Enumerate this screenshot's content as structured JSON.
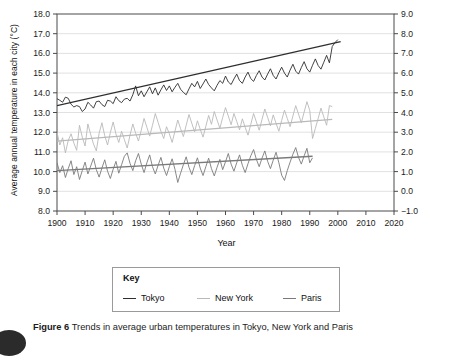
{
  "figure": {
    "caption_label": "Figure 6",
    "caption_text": "Trends in average urban temperatures in Tokyo, New York and Paris"
  },
  "legend": {
    "title": "Key",
    "entries": [
      {
        "label": "Tokyo",
        "color": "#2e2e2e"
      },
      {
        "label": "New York",
        "color": "#b9b9b9"
      },
      {
        "label": "Paris",
        "color": "#7a7a7a"
      }
    ]
  },
  "chart_data": {
    "type": "line",
    "title": "",
    "xlabel": "Year",
    "ylabel": "Average annual temperature in each city  (°C)",
    "y2label": "",
    "xlim": [
      1900,
      2020
    ],
    "ylim": [
      8.0,
      18.0
    ],
    "y2lim": [
      -1.0,
      9.0
    ],
    "grid": true,
    "legend_position": "below-plot",
    "xticks": [
      1900,
      1910,
      1920,
      1930,
      1940,
      1950,
      1960,
      1970,
      1980,
      1990,
      2000,
      2010,
      2020
    ],
    "xticklabels": [
      "1900",
      "1910",
      "1920",
      "1930",
      "1940",
      "1950",
      "1960",
      "1970",
      "1980",
      "1990",
      "2000",
      "2010",
      "2020"
    ],
    "yticks": [
      8.0,
      9.0,
      10.0,
      11.0,
      12.0,
      13.0,
      14.0,
      15.0,
      16.0,
      17.0,
      18.0
    ],
    "yticklabels": [
      "8.0",
      "9.0",
      "10.0",
      "11.0",
      "12.0",
      "13.0",
      "14.0",
      "15.0",
      "16.0",
      "17.0",
      "18.0"
    ],
    "y2ticks": [
      -1.0,
      0.0,
      1.0,
      2.0,
      3.0,
      4.0,
      5.0,
      6.0,
      7.0,
      8.0,
      9.0
    ],
    "y2ticklabels": [
      "−1.0",
      "0.0",
      "1.0",
      "2.0",
      "3.0",
      "4.0",
      "5.0",
      "6.0",
      "7.0",
      "8.0",
      "9.0"
    ],
    "series": [
      {
        "name": "Tokyo",
        "color": "#2e2e2e",
        "axis": "left",
        "x_start": 1900,
        "x_end": 2001,
        "trend": {
          "start_year": 1900,
          "end_year": 2001,
          "start_value": 13.35,
          "end_value": 16.6
        },
        "values": [
          13.7,
          13.62,
          13.52,
          13.78,
          13.72,
          13.42,
          13.28,
          13.35,
          13.3,
          13.05,
          13.18,
          13.52,
          13.38,
          13.22,
          13.55,
          13.58,
          13.4,
          13.3,
          13.62,
          13.58,
          13.45,
          13.8,
          13.6,
          13.5,
          13.68,
          13.72,
          13.58,
          13.9,
          14.35,
          13.85,
          14.1,
          13.8,
          14.05,
          14.3,
          13.95,
          14.25,
          13.88,
          14.15,
          14.4,
          14.12,
          14.35,
          14.05,
          14.28,
          14.48,
          14.18,
          14.02,
          13.9,
          14.2,
          14.48,
          14.3,
          14.58,
          14.22,
          14.45,
          14.7,
          14.42,
          14.25,
          14.1,
          14.38,
          14.62,
          14.48,
          14.85,
          14.55,
          14.42,
          14.7,
          14.95,
          14.62,
          14.48,
          14.8,
          15.05,
          14.72,
          14.58,
          14.88,
          15.12,
          14.8,
          14.65,
          14.95,
          15.22,
          14.88,
          14.7,
          15.02,
          15.3,
          15.0,
          14.8,
          15.15,
          15.45,
          15.1,
          14.95,
          15.28,
          15.58,
          15.22,
          15.05,
          15.4,
          15.72,
          15.38,
          15.2,
          15.55,
          15.9,
          15.52,
          16.35,
          16.55,
          16.7
        ]
      },
      {
        "name": "New York",
        "color": "#b9b9b9",
        "axis": "left",
        "x_start": 1900,
        "x_end": 1998,
        "trend": {
          "start_year": 1900,
          "end_year": 1998,
          "start_value": 11.55,
          "end_value": 12.65
        },
        "values": [
          12.0,
          11.35,
          11.72,
          10.95,
          11.58,
          11.92,
          11.45,
          11.08,
          12.35,
          11.75,
          11.3,
          12.42,
          11.88,
          11.4,
          11.05,
          11.95,
          12.48,
          11.82,
          11.35,
          11.98,
          12.52,
          11.9,
          11.48,
          12.05,
          11.62,
          11.2,
          11.85,
          12.42,
          11.95,
          11.55,
          12.1,
          12.7,
          12.25,
          11.8,
          12.35,
          12.95,
          12.5,
          12.05,
          11.68,
          12.28,
          11.92,
          11.48,
          12.05,
          12.62,
          12.18,
          11.78,
          12.35,
          12.9,
          12.45,
          12.02,
          12.58,
          12.15,
          11.75,
          12.3,
          12.85,
          12.4,
          13.05,
          12.62,
          12.2,
          12.75,
          13.25,
          12.82,
          12.38,
          12.95,
          12.55,
          12.12,
          12.68,
          12.25,
          11.85,
          12.4,
          12.95,
          12.52,
          12.1,
          12.65,
          13.18,
          12.75,
          12.32,
          12.88,
          12.45,
          12.05,
          12.6,
          13.12,
          12.7,
          12.28,
          12.82,
          13.35,
          12.92,
          12.48,
          13.02,
          13.55,
          13.1,
          11.68,
          12.2,
          12.7,
          13.22,
          12.78,
          12.35,
          13.35,
          13.3
        ]
      },
      {
        "name": "Paris",
        "color": "#7a7a7a",
        "axis": "left",
        "x_start": 1900,
        "x_end": 1991,
        "trend": {
          "start_year": 1900,
          "end_year": 1991,
          "start_value": 10.05,
          "end_value": 10.78
        },
        "values": [
          10.45,
          9.95,
          10.3,
          9.7,
          10.15,
          10.55,
          9.85,
          10.25,
          9.6,
          10.05,
          10.48,
          9.88,
          10.28,
          10.68,
          10.1,
          9.72,
          10.18,
          10.6,
          10.02,
          9.65,
          10.12,
          10.52,
          9.92,
          10.35,
          10.78,
          10.95,
          10.42,
          10.05,
          10.55,
          10.92,
          10.38,
          9.95,
          10.45,
          10.85,
          10.25,
          9.88,
          10.32,
          10.72,
          10.18,
          9.8,
          10.25,
          10.65,
          10.12,
          9.45,
          9.92,
          10.35,
          10.75,
          10.22,
          9.85,
          10.3,
          10.7,
          10.18,
          9.8,
          10.25,
          10.68,
          10.15,
          9.78,
          10.22,
          10.62,
          10.1,
          10.5,
          10.92,
          10.38,
          10.02,
          10.45,
          10.85,
          10.32,
          9.95,
          10.4,
          10.8,
          11.12,
          10.62,
          10.25,
          10.68,
          11.05,
          10.52,
          10.15,
          10.58,
          10.98,
          10.45,
          9.82,
          9.55,
          10.05,
          10.48,
          10.88,
          11.22,
          10.72,
          10.38,
          10.8,
          11.18,
          10.45,
          10.7
        ]
      }
    ]
  }
}
